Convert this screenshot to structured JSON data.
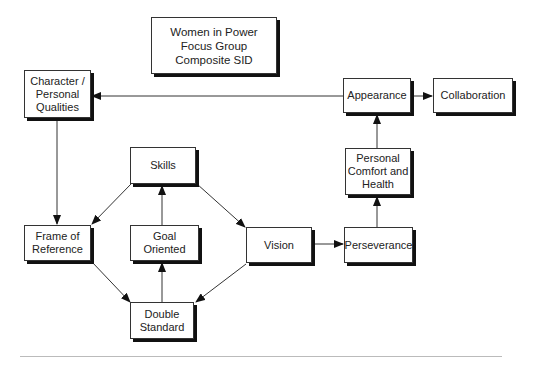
{
  "title": "Women in Power\nFocus Group\nComposite SID",
  "nodes": {
    "character": "Character /\nPersonal\nQualities",
    "appearance": "Appearance",
    "collaboration": "Collaboration",
    "comfort": "Personal\nComfort and\nHealth",
    "skills": "Skills",
    "frame": "Frame of\nReference",
    "goal": "Goal Oriented",
    "vision": "Vision",
    "perseverance": "Perseverance",
    "double": "Double\nStandard"
  },
  "edges": [
    {
      "from": "Appearance",
      "to": "Character / Personal Qualities"
    },
    {
      "from": "Appearance",
      "to": "Collaboration"
    },
    {
      "from": "Personal Comfort and Health",
      "to": "Appearance"
    },
    {
      "from": "Perseverance",
      "to": "Personal Comfort and Health"
    },
    {
      "from": "Vision",
      "to": "Perseverance"
    },
    {
      "from": "Character / Personal Qualities",
      "to": "Frame of Reference"
    },
    {
      "from": "Skills",
      "to": "Frame of Reference"
    },
    {
      "from": "Skills",
      "to": "Vision"
    },
    {
      "from": "Goal Oriented",
      "to": "Skills"
    },
    {
      "from": "Double Standard",
      "to": "Goal Oriented"
    },
    {
      "from": "Frame of Reference",
      "to": "Double Standard"
    },
    {
      "from": "Vision",
      "to": "Double Standard"
    }
  ]
}
